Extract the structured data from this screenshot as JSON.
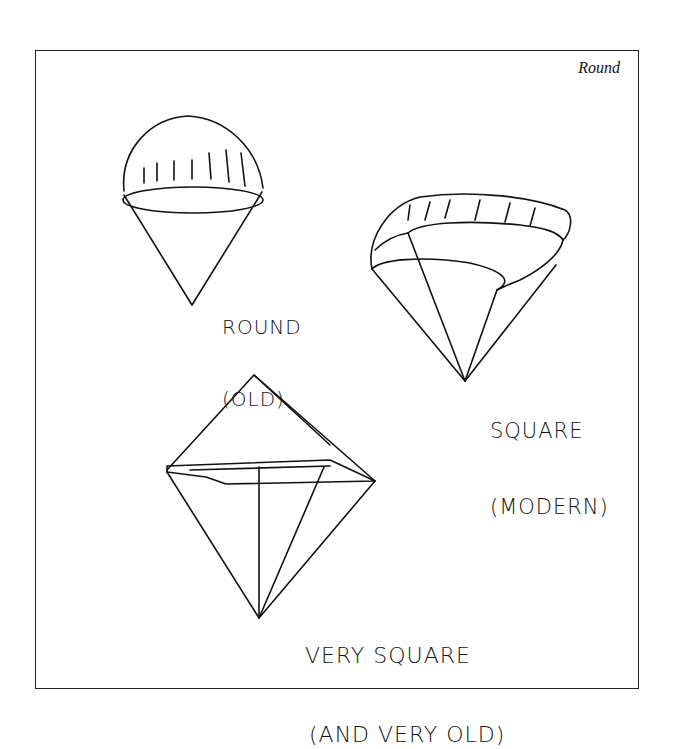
{
  "frame": {
    "title": "Round"
  },
  "illustrations": [
    {
      "name": "round-parachute",
      "label_line1": "ROUND",
      "label_line2": "(OLD)"
    },
    {
      "name": "square-parachute",
      "label_line1": "SQUARE",
      "label_line2": "(MODERN)"
    },
    {
      "name": "very-square-parachute",
      "label_line1": "VERY SQUARE",
      "label_line2": "(AND VERY OLD)"
    }
  ],
  "colors": {
    "ink": "#111111",
    "background": "#ffffff"
  }
}
